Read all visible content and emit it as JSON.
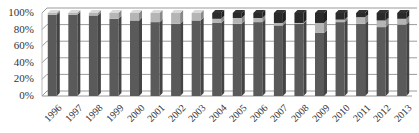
{
  "chart_data": {
    "type": "bar",
    "stacked": true,
    "percent_stacked": true,
    "three_d": true,
    "title": "",
    "xlabel": "",
    "ylabel": "",
    "ylim": [
      0,
      100
    ],
    "y_ticks": [
      "0%",
      "20%",
      "40%",
      "60%",
      "80%",
      "100%"
    ],
    "grid": true,
    "legend": null,
    "categories": [
      "1996",
      "1997",
      "1998",
      "1999",
      "2000",
      "2001",
      "2002",
      "2003",
      "2004",
      "2005",
      "2006",
      "2007",
      "2008",
      "2009",
      "2010",
      "2011",
      "2012",
      "2013"
    ],
    "series": [
      {
        "name": "Series 1",
        "color": "#5a5a5a",
        "values": [
          98,
          98,
          97,
          93,
          91,
          89,
          87,
          91,
          88,
          87,
          89,
          85,
          87,
          76,
          89,
          87,
          83,
          86
        ]
      },
      {
        "name": "Series 2",
        "color": "#b5b5b5",
        "values": [
          2,
          2,
          3,
          7,
          9,
          11,
          13,
          9,
          5,
          7,
          5,
          3,
          1,
          12,
          3,
          8,
          8,
          7
        ]
      },
      {
        "name": "Series 3",
        "color": "#2a2a2a",
        "values": [
          0,
          0,
          0,
          0,
          0,
          0,
          0,
          0,
          7,
          6,
          6,
          12,
          12,
          12,
          8,
          5,
          9,
          7
        ]
      }
    ]
  }
}
